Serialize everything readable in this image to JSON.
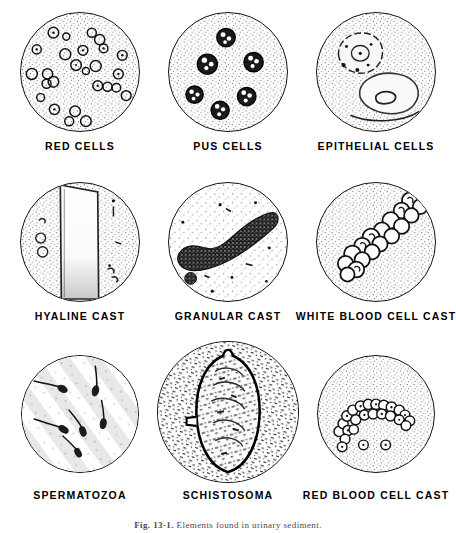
{
  "figure": {
    "caption_prefix": "Fig. 13-1.",
    "caption_text": "Elements found in urinary sediment.",
    "ink_color": "#111111",
    "background_color": "#ffffff",
    "stipple_color": "#555555"
  },
  "panels": [
    {
      "id": "red-cells",
      "label": "RED CELLS",
      "row": 1,
      "column": 1,
      "circle": {
        "cx": 80,
        "cy": 72,
        "r": 60
      },
      "label_y": 140,
      "content_kind": "scattered-rings",
      "stipple_density": "medium"
    },
    {
      "id": "pus-cells",
      "label": "PUS CELLS",
      "row": 1,
      "column": 2,
      "circle": {
        "cx": 228,
        "cy": 72,
        "r": 60
      },
      "label_y": 140,
      "content_kind": "dark-lobed-cells",
      "stipple_density": "medium"
    },
    {
      "id": "epithelial-cells",
      "label": "EPITHELIAL CELLS",
      "row": 1,
      "column": 3,
      "circle": {
        "cx": 376,
        "cy": 72,
        "r": 60
      },
      "label_y": 140,
      "content_kind": "large-flat-cells",
      "stipple_density": "medium"
    },
    {
      "id": "hyaline-cast",
      "label": "HYALINE CAST",
      "row": 2,
      "column": 1,
      "circle": {
        "cx": 80,
        "cy": 242,
        "r": 60
      },
      "label_y": 310,
      "content_kind": "pale-cylinder",
      "stipple_density": "medium"
    },
    {
      "id": "granular-cast",
      "label": "GRANULAR CAST",
      "row": 2,
      "column": 2,
      "circle": {
        "cx": 228,
        "cy": 242,
        "r": 60
      },
      "label_y": 310,
      "content_kind": "dark-granular-cylinder",
      "stipple_density": "light"
    },
    {
      "id": "white-blood-cell-cast",
      "label": "WHITE BLOOD CELL CAST",
      "row": 2,
      "column": 3,
      "circle": {
        "cx": 376,
        "cy": 242,
        "r": 60
      },
      "label_y": 310,
      "content_kind": "packed-cell-column",
      "stipple_density": "medium"
    },
    {
      "id": "spermatozoa",
      "label": "SPERMATOZOA",
      "row": 3,
      "column": 1,
      "circle": {
        "cx": 80,
        "cy": 414,
        "r": 59
      },
      "label_y": 489,
      "content_kind": "tadpole-forms",
      "stipple_density": "streaked"
    },
    {
      "id": "schistosoma",
      "label": "SCHISTOSOMA",
      "row": 3,
      "column": 2,
      "circle": {
        "cx": 228,
        "cy": 412,
        "r": 71
      },
      "label_y": 489,
      "content_kind": "ovum-with-spine",
      "stipple_density": "heavy"
    },
    {
      "id": "red-blood-cell-cast",
      "label": "RED BLOOD CELL CAST",
      "row": 3,
      "column": 3,
      "circle": {
        "cx": 376,
        "cy": 414,
        "r": 59
      },
      "label_y": 489,
      "content_kind": "arc-of-rings",
      "stipple_density": "medium"
    }
  ]
}
